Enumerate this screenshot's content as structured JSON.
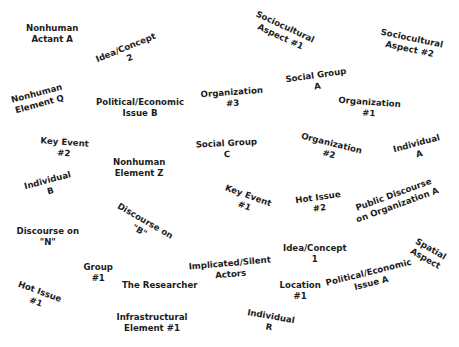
{
  "diagram": {
    "type": "situational-map",
    "title_fragment": "",
    "nodes": [
      {
        "id": "nonhuman-actant-a",
        "line1": "Nonhuman",
        "line2": "Actant A",
        "x": 52,
        "y": 34,
        "rotate": 0
      },
      {
        "id": "idea-concept-2",
        "line1": "Idea/Concept",
        "line2": "2",
        "x": 128,
        "y": 53,
        "rotate": -22
      },
      {
        "id": "sociocultural-aspect-1",
        "line1": "Sociocultural",
        "line2": "Aspect #1",
        "x": 282,
        "y": 32,
        "rotate": 25
      },
      {
        "id": "sociocultural-aspect-2",
        "line1": "Sociocultural",
        "line2": "Aspect #2",
        "x": 410,
        "y": 44,
        "rotate": 12
      },
      {
        "id": "nonhuman-element-q",
        "line1": "Nonhuman",
        "line2": "Element Q",
        "x": 38,
        "y": 99,
        "rotate": -15
      },
      {
        "id": "political-economic-issue-b",
        "line1": "Political/Economic",
        "line2": "Issue B",
        "x": 140,
        "y": 108,
        "rotate": 0
      },
      {
        "id": "organization-3",
        "line1": "Organization",
        "line2": "#3",
        "x": 232,
        "y": 98,
        "rotate": -4
      },
      {
        "id": "social-group-a",
        "line1": "Social Group",
        "line2": "A",
        "x": 316,
        "y": 81,
        "rotate": -8
      },
      {
        "id": "organization-1",
        "line1": "Organization",
        "line2": "#1",
        "x": 369,
        "y": 108,
        "rotate": 4
      },
      {
        "id": "key-event-2",
        "line1": "Key Event",
        "line2": "#2",
        "x": 64,
        "y": 148,
        "rotate": 4
      },
      {
        "id": "social-group-c",
        "line1": "Social Group",
        "line2": "C",
        "x": 226,
        "y": 149,
        "rotate": -3
      },
      {
        "id": "organization-2",
        "line1": "Organization",
        "line2": "#2",
        "x": 330,
        "y": 149,
        "rotate": 14
      },
      {
        "id": "individual-a",
        "line1": "Individual",
        "line2": "A",
        "x": 418,
        "y": 149,
        "rotate": -15
      },
      {
        "id": "nonhuman-element-z",
        "line1": "Nonhuman",
        "line2": "Element Z",
        "x": 139,
        "y": 168,
        "rotate": 0
      },
      {
        "id": "individual-b",
        "line1": "Individual",
        "line2": "B",
        "x": 49,
        "y": 186,
        "rotate": -15
      },
      {
        "id": "key-event-1",
        "line1": "Key Event",
        "line2": "#1",
        "x": 246,
        "y": 201,
        "rotate": 20
      },
      {
        "id": "hot-issue-2",
        "line1": "Hot Issue",
        "line2": "#2",
        "x": 319,
        "y": 203,
        "rotate": -8
      },
      {
        "id": "public-discourse-org-a",
        "line1": "Public Discourse",
        "line2": "on Organization A",
        "x": 395,
        "y": 200,
        "rotate": -20
      },
      {
        "id": "discourse-on-n",
        "line1": "Discourse on",
        "line2": "\"N\"",
        "x": 48,
        "y": 237,
        "rotate": 0
      },
      {
        "id": "discourse-on-b",
        "line1": "Discourse on",
        "line2": "\"B\"",
        "x": 142,
        "y": 226,
        "rotate": 30
      },
      {
        "id": "idea-concept-1",
        "line1": "Idea/Concept",
        "line2": "1",
        "x": 315,
        "y": 254,
        "rotate": 0
      },
      {
        "id": "spatial-aspect",
        "line1": "Spatial",
        "line2": "Aspect",
        "x": 428,
        "y": 254,
        "rotate": 30
      },
      {
        "id": "group-1",
        "line1": "Group",
        "line2": "#1",
        "x": 98,
        "y": 273,
        "rotate": 0
      },
      {
        "id": "implicated-silent-actors",
        "line1": "Implicated/Silent",
        "line2": "Actors",
        "x": 230,
        "y": 269,
        "rotate": -5
      },
      {
        "id": "the-researcher",
        "line1": "The Researcher",
        "line2": "",
        "x": 160,
        "y": 285,
        "rotate": 0
      },
      {
        "id": "location-1",
        "line1": "Location",
        "line2": "#1",
        "x": 300,
        "y": 291,
        "rotate": 0
      },
      {
        "id": "political-economic-issue-a",
        "line1": "Political/Economic",
        "line2": "Issue A",
        "x": 370,
        "y": 278,
        "rotate": -14
      },
      {
        "id": "hot-issue-1",
        "line1": "Hot Issue",
        "line2": "#1",
        "x": 38,
        "y": 297,
        "rotate": 20
      },
      {
        "id": "infrastructural-element-1",
        "line1": "Infrastructural",
        "line2": "Element #1",
        "x": 152,
        "y": 323,
        "rotate": 0
      },
      {
        "id": "individual-r",
        "line1": "Individual",
        "line2": "R",
        "x": 270,
        "y": 322,
        "rotate": 10
      }
    ]
  },
  "colors": {
    "background": "#ffffff",
    "text": "#1c1c1c"
  }
}
